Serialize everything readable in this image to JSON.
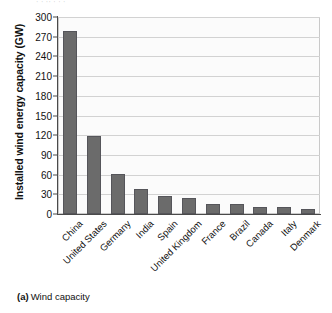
{
  "figure": {
    "top_cutoff_text": "ˌ    ˌ ˌˌ ˌ      ˌ     ˌ",
    "caption_tag": "(a)",
    "caption_text": "Wind capacity"
  },
  "axis": {
    "y_title": "Installed wind energy capacity (GW)",
    "y_ticks": [
      "0",
      "30",
      "60",
      "90",
      "120",
      "150",
      "180",
      "210",
      "240",
      "270",
      "300"
    ]
  },
  "colors": {
    "bar_fill": "#6b6b6b",
    "bar_stroke": "#55555a",
    "gridline": "#d2d2d2",
    "plot_background": "#fbfbfb",
    "axis_spine": "#4a4a4a",
    "text": "#111111"
  },
  "chart_data": {
    "type": "bar",
    "title": "",
    "subtitle": "",
    "xlabel": "",
    "ylabel": "Installed wind energy capacity (GW)",
    "ylim": [
      0,
      300
    ],
    "ytick_step": 30,
    "grid": true,
    "legend": false,
    "legend_position": "none",
    "orientation": "vertical",
    "categories": [
      "China",
      "United States",
      "Germany",
      "India",
      "Spain",
      "United Kingdom",
      "France",
      "Brazil",
      "Canada",
      "Italy",
      "Denmark"
    ],
    "values": [
      279,
      119,
      61,
      38,
      27,
      24,
      16,
      15,
      11,
      10,
      7
    ],
    "units": "GW",
    "annotations": []
  }
}
